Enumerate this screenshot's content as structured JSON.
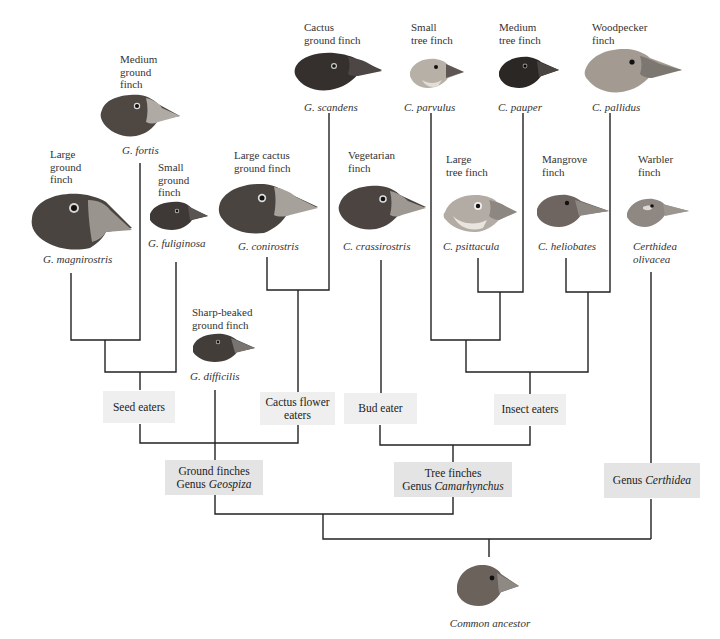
{
  "diagram": {
    "type": "phylogenetic-tree",
    "colors": {
      "line": "#222222",
      "group_box": "#efefef",
      "genus_box": "#e4e4e4",
      "text": "#2a2a2a"
    }
  },
  "species": [
    {
      "id": "magnirostris",
      "common": "Large\nground\nfinch",
      "scientific": "G. magnirostris"
    },
    {
      "id": "fortis",
      "common": "Medium\nground\nfinch",
      "scientific": "G. fortis"
    },
    {
      "id": "fuliginosa",
      "common": "Small\nground\nfinch",
      "scientific": "G. fuliginosa"
    },
    {
      "id": "difficilis",
      "common": "Sharp-beaked\nground finch",
      "scientific": "G. difficilis"
    },
    {
      "id": "conirostris",
      "common": "Large cactus\nground finch",
      "scientific": "G. conirostris"
    },
    {
      "id": "scandens",
      "common": "Cactus\nground finch",
      "scientific": "G. scandens"
    },
    {
      "id": "crassirostris",
      "common": "Vegetarian\nfinch",
      "scientific": "C. crassirostris"
    },
    {
      "id": "parvulus",
      "common": "Small\ntree finch",
      "scientific": "C. parvulus"
    },
    {
      "id": "psittacula",
      "common": "Large\ntree finch",
      "scientific": "C. psittacula"
    },
    {
      "id": "pauper",
      "common": "Medium\ntree finch",
      "scientific": "C. pauper"
    },
    {
      "id": "heliobates",
      "common": "Mangrove\nfinch",
      "scientific": "C. heliobates"
    },
    {
      "id": "pallidus",
      "common": "Woodpecker\nfinch",
      "scientific": "C. pallidus"
    },
    {
      "id": "olivacea",
      "common": "Warbler\nfinch",
      "scientific": "Certhidea\nolivacea"
    }
  ],
  "diet_groups": {
    "seed": "Seed eaters",
    "cactus": "Cactus flower\neaters",
    "bud": "Bud eater",
    "insect": "Insect eaters"
  },
  "genera": {
    "geospiza": {
      "line1": "Ground finches",
      "prefix": "Genus ",
      "genus": "Geospiza"
    },
    "camarhynchus": {
      "line1": "Tree finches",
      "prefix": "Genus ",
      "genus": "Camarhynchus"
    },
    "certhidea": {
      "prefix": "Genus ",
      "genus": "Certhidea"
    }
  },
  "root": {
    "label": "Common ancestor"
  }
}
